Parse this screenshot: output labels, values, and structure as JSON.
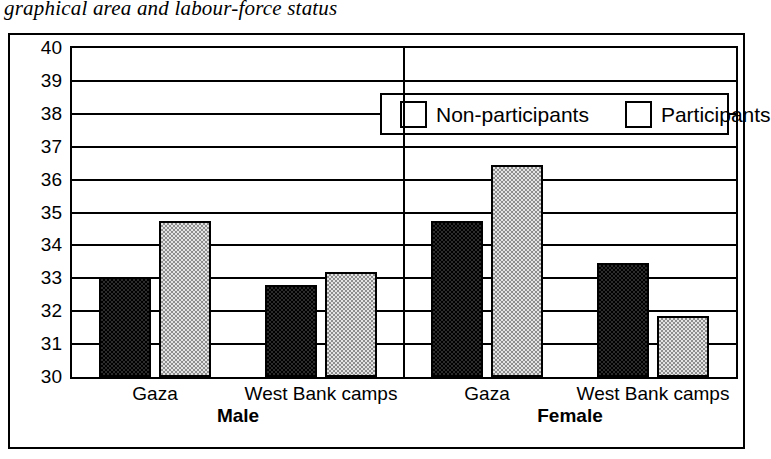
{
  "caption": "graphical area and labour-force status",
  "legend": {
    "items": [
      {
        "label": "Non-participants",
        "swatch": "dark-swatch",
        "color": "#2b2b2b"
      },
      {
        "label": "Participants",
        "swatch": "light-swatch",
        "color": "#e3e3e3"
      }
    ]
  },
  "groups": [
    {
      "name": "Male"
    },
    {
      "name": "Female"
    }
  ],
  "chart_data": {
    "type": "bar",
    "title": "graphical area and labour-force status",
    "xlabel": "",
    "ylabel": "",
    "ylim": [
      30,
      40
    ],
    "ytick_labels": [
      "40",
      "39",
      "38",
      "37",
      "36",
      "35",
      "34",
      "33",
      "32",
      "31",
      "30"
    ],
    "yticks": [
      40,
      39,
      38,
      37,
      36,
      35,
      34,
      33,
      32,
      31,
      30
    ],
    "grid": true,
    "legend_position": "bottom-right",
    "group_labels": [
      "Male",
      "Female"
    ],
    "categories": [
      "Gaza",
      "West Bank camps",
      "Gaza",
      "West Bank camps"
    ],
    "category_groups": [
      "Male",
      "Male",
      "Female",
      "Female"
    ],
    "series": [
      {
        "name": "Non-participants",
        "values": [
          33.05,
          32.8,
          34.75,
          33.45
        ]
      },
      {
        "name": "Participants",
        "values": [
          34.75,
          33.2,
          36.45,
          31.85
        ]
      }
    ]
  }
}
